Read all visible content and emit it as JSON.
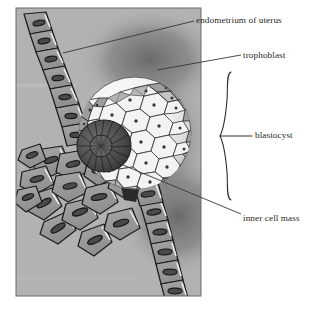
{
  "figure": {
    "title_implicit": "Implantation of the blastocyst in the endometrium",
    "panel": {
      "background_color": "#b2b2b2",
      "x": 16,
      "y": 8,
      "width": 185,
      "height": 288,
      "frame_color": "#6e6b68"
    },
    "labels": [
      {
        "id": "endometrium",
        "text": "endometrium of uterus",
        "x": 196,
        "y": 16
      },
      {
        "id": "trophoblast",
        "text": "trophoblast",
        "x": 243,
        "y": 51
      },
      {
        "id": "blastocyst",
        "text": "blastocyst",
        "x": 255,
        "y": 131
      },
      {
        "id": "inner_cell_mass",
        "text": "inner cell mass",
        "x": 243,
        "y": 214
      }
    ],
    "leaders": [
      {
        "id": "leader-endometrium",
        "from_x": 63,
        "from_y": 53,
        "to_x": 194,
        "to_y": 21
      },
      {
        "id": "leader-trophoblast",
        "from_x": 157,
        "from_y": 70,
        "to_x": 241,
        "to_y": 55
      },
      {
        "id": "leader-inner-cell-mass",
        "from_x": 123,
        "from_y": 165,
        "to_x": 241,
        "to_y": 214
      }
    ],
    "brace": {
      "id": "blastocyst-brace",
      "x": 228,
      "top_y": 72,
      "bottom_y": 198,
      "mid_y": 136,
      "tick_to_x": 252,
      "color": "#2f2c29"
    },
    "colors": {
      "text": "#2a2724",
      "leader_line": "#3a3734",
      "panel_bg": "#b2b2b2",
      "cell_fill": "#9a9a9a",
      "cell_fill_light": "#ababab",
      "cell_outline": "#1d1b19",
      "nucleus": "#4c4a48",
      "highlight": "#ededed",
      "blastocyst_fill": "#efefef",
      "blastocyst_rim": "#8e8e8e",
      "inner_cell_mass": "#4a4a4a",
      "shadow": "#7d7d7d"
    },
    "structures": [
      {
        "id": "endometrium-upper-chain",
        "name": "endometrium epithelial cell chain (upper left)",
        "cell_count": 7
      },
      {
        "id": "endometrium-lower-chain",
        "name": "endometrium epithelial cell chain (lower right)",
        "cell_count": 6
      },
      {
        "id": "endometrium-cluster",
        "name": "displaced endometrial cell cluster (lower left)",
        "cell_count": 14
      },
      {
        "id": "blastocyst-sphere",
        "name": "blastocyst",
        "cx": 135,
        "cy": 133,
        "r": 56
      },
      {
        "id": "trophoblast-layer",
        "name": "trophoblast cell layer",
        "cell_count": 62
      },
      {
        "id": "inner-cell-mass-dome",
        "name": "inner cell mass",
        "cx": 104,
        "cy": 146,
        "rx": 27,
        "ry": 26
      }
    ]
  }
}
